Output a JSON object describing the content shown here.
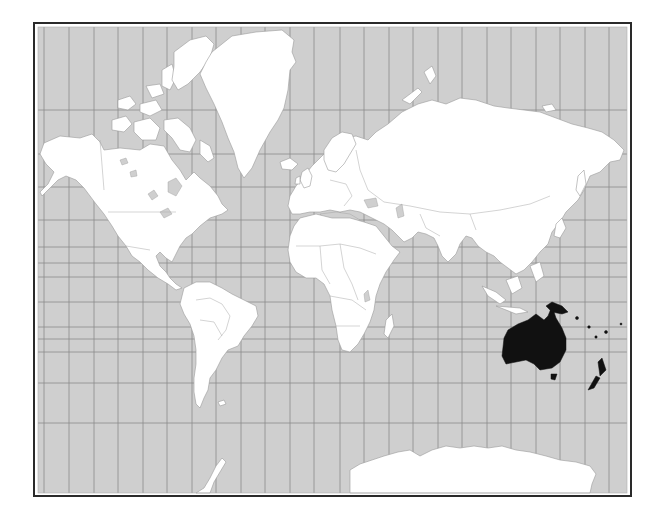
{
  "map": {
    "title": "World map (Mercator projection) with Oceania highlighted",
    "projection": "Mercator",
    "highlighted_region": "Oceania",
    "highlighted_countries": [
      "Australia",
      "Papua New Guinea",
      "New Zealand",
      "Pacific Islands"
    ],
    "colors": {
      "ocean": "#cfcfcf",
      "land": "#ffffff",
      "highlight": "#111111",
      "frame": "#2a2a2a",
      "grid": "#8a8a8a"
    },
    "graticule": {
      "meridian_x": [
        44,
        69,
        94,
        118,
        143,
        167,
        192,
        216,
        241,
        265,
        290,
        314,
        340,
        364,
        389,
        413,
        438,
        462,
        487,
        511,
        536,
        560,
        585,
        609
      ],
      "parallel_y": [
        110,
        154,
        187,
        220,
        247,
        263,
        277,
        302,
        327,
        339,
        352,
        383,
        423
      ]
    },
    "continents": [
      "North America",
      "Greenland",
      "South America",
      "Europe",
      "Africa",
      "Asia",
      "Oceania",
      "Antarctica"
    ]
  }
}
